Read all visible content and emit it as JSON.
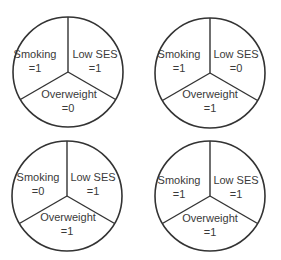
{
  "diagram": {
    "type": "sufficient-component-cause pies",
    "components": [
      "Smoking",
      "Low SES",
      "Overweight"
    ],
    "pies": [
      {
        "smoking": "Smoking",
        "smoking_val": "=1",
        "ses": "Low SES",
        "ses_val": "=1",
        "overweight": "Overweight",
        "overweight_val": "=0"
      },
      {
        "smoking": "Smoking",
        "smoking_val": "=1",
        "ses": "Low SES",
        "ses_val": "=0",
        "overweight": "Overweight",
        "overweight_val": "=1"
      },
      {
        "smoking": "Smoking",
        "smoking_val": "=0",
        "ses": "Low SES",
        "ses_val": "=1",
        "overweight": "Overweight",
        "overweight_val": "=1"
      },
      {
        "smoking": "Smoking",
        "smoking_val": "=1",
        "ses": "Low SES",
        "ses_val": "=1",
        "overweight": "Overweight",
        "overweight_val": "=1"
      }
    ]
  }
}
